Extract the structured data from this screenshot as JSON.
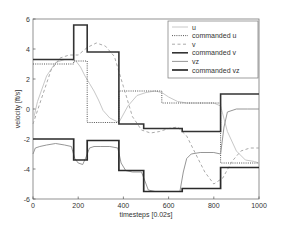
{
  "chart_data": {
    "type": "line",
    "title": "",
    "xlabel": "timesteps [0.02s]",
    "ylabel": "velocity [ft/s]",
    "xlim": [
      0,
      1000
    ],
    "ylim": [
      -6,
      6
    ],
    "xticks": [
      0,
      200,
      400,
      600,
      800,
      1000
    ],
    "yticks": [
      -6,
      -4,
      -2,
      0,
      2,
      4,
      6
    ],
    "xtick_labels": [
      "0",
      "200",
      "400",
      "600",
      "800",
      "1000"
    ],
    "ytick_labels": [
      "-6",
      "-4",
      "-2",
      "0",
      "2",
      "4",
      "6"
    ],
    "grid": false,
    "legend_position": "top-right",
    "series": [
      {
        "name": "u",
        "style": "solid-light",
        "x": [
          0,
          20,
          60,
          100,
          140,
          170,
          190,
          210,
          230,
          250,
          270,
          290,
          310,
          340,
          380,
          420,
          460,
          500,
          540,
          570,
          600,
          640,
          680,
          720,
          760,
          800,
          830,
          860,
          900,
          940,
          980,
          1000
        ],
        "y": [
          -0.8,
          0.5,
          2.2,
          3.1,
          3.3,
          3.3,
          3.2,
          2.8,
          2.2,
          1.7,
          1.2,
          0.6,
          -0.1,
          -0.6,
          -0.9,
          0.2,
          0.9,
          1.1,
          1.2,
          1.1,
          0.8,
          0.5,
          0.4,
          0.4,
          0.4,
          0.4,
          0.2,
          -1.5,
          -2.8,
          -3.4,
          -3.5,
          -3.6
        ]
      },
      {
        "name": "commanded u",
        "style": "dotted",
        "x": [
          0,
          180,
          180,
          240,
          240,
          380,
          380,
          570,
          570,
          830,
          830,
          1000
        ],
        "y": [
          3.0,
          3.0,
          3.2,
          3.2,
          -0.9,
          -0.9,
          1.2,
          1.2,
          0.4,
          0.4,
          -3.6,
          -3.6
        ]
      },
      {
        "name": "v",
        "style": "dash-light",
        "x": [
          0,
          40,
          80,
          120,
          160,
          200,
          240,
          280,
          320,
          360,
          400,
          440,
          480,
          520,
          560,
          600,
          640,
          680,
          720,
          760,
          800,
          840,
          880,
          920,
          960,
          1000
        ],
        "y": [
          -1.0,
          0.8,
          2.6,
          3.4,
          3.6,
          3.6,
          4.1,
          4.4,
          4.2,
          3.5,
          1.5,
          -0.5,
          -1.4,
          -1.6,
          -1.5,
          -1.3,
          -1.2,
          -1.8,
          -3.0,
          -4.2,
          -5.0,
          -4.6,
          -3.5,
          -2.8,
          -2.6,
          -2.6
        ]
      },
      {
        "name": "commanded v",
        "style": "dash-dot",
        "x": [
          0,
          180,
          180,
          240,
          240,
          380,
          380,
          490,
          490,
          660,
          660,
          830,
          830,
          1000
        ],
        "y": [
          3.3,
          3.3,
          5.6,
          5.6,
          3.8,
          3.8,
          -1.0,
          -1.0,
          -1.3,
          -1.3,
          -1.5,
          -1.5,
          1.0,
          1.0
        ]
      },
      {
        "name": "vz",
        "style": "solid-thin",
        "x": [
          0,
          10,
          30,
          60,
          100,
          140,
          170,
          185,
          200,
          220,
          235,
          250,
          270,
          300,
          340,
          375,
          390,
          410,
          440,
          480,
          495,
          510,
          540,
          600,
          650,
          665,
          680,
          700,
          740,
          800,
          830,
          845,
          860,
          900,
          950,
          1000
        ],
        "y": [
          -3.0,
          -2.6,
          -2.5,
          -2.4,
          -2.3,
          -2.4,
          -2.5,
          -3.3,
          -3.6,
          -3.7,
          -3.2,
          -2.6,
          -2.5,
          -2.5,
          -2.5,
          -2.6,
          -3.6,
          -4.1,
          -4.2,
          -4.2,
          -4.8,
          -5.4,
          -5.5,
          -5.5,
          -5.5,
          -4.2,
          -3.3,
          -3.0,
          -2.9,
          -2.9,
          -3.0,
          -1.2,
          -0.2,
          0.0,
          0.0,
          0.0
        ]
      },
      {
        "name": "commanded vz",
        "style": "solid-thick",
        "x": [
          0,
          180,
          180,
          240,
          240,
          380,
          380,
          490,
          490,
          660,
          660,
          830,
          830,
          1000
        ],
        "y": [
          -2.0,
          -2.0,
          -3.4,
          -3.4,
          -2.1,
          -2.1,
          -4.1,
          -4.1,
          -5.5,
          -5.5,
          -5.3,
          -5.3,
          -3.9,
          -3.9
        ]
      }
    ]
  }
}
